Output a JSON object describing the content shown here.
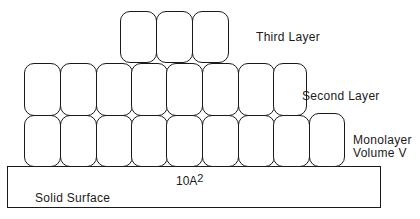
{
  "diagram": {
    "type": "adsorption-layers",
    "labels": {
      "third_layer": "Third Layer",
      "second_layer": "Second Layer",
      "monolayer_line1": "Monolayer",
      "monolayer_line2": "Volume  V",
      "solid_surface": "Solid  Surface",
      "area_value": "10A",
      "area_exponent": "2"
    },
    "layers": [
      {
        "name": "monolayer",
        "molecule_count": 11
      },
      {
        "name": "second-layer",
        "molecule_count": 8
      },
      {
        "name": "third-layer",
        "molecule_count": 3
      }
    ],
    "colors": {
      "stroke": "#1a1a1a",
      "background": "#ffffff"
    }
  }
}
